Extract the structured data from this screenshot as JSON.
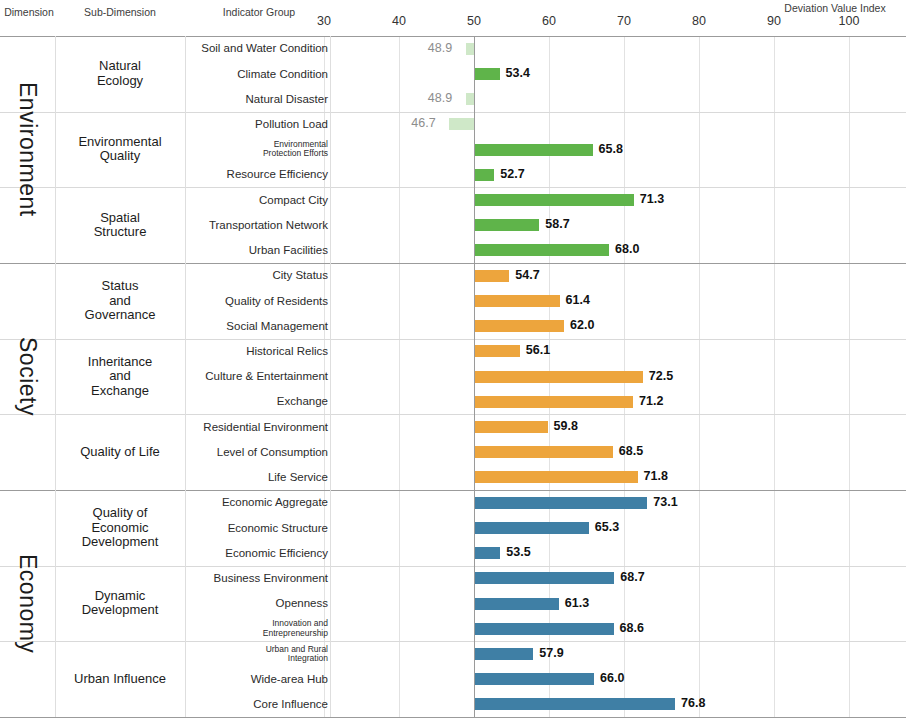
{
  "headers": {
    "dimension": "Dimension",
    "sub_dimension": "Sub-Dimension",
    "indicator_group": "Indicator Group",
    "axis_title": "Deviation Value Index"
  },
  "chart_data": {
    "type": "bar",
    "title": "Deviation Value Index",
    "orientation": "horizontal",
    "baseline": 50,
    "xlabel": "Deviation Value Index",
    "ylabel": "",
    "xlim": [
      25,
      103
    ],
    "ticks": [
      30,
      40,
      50,
      60,
      70,
      80,
      90,
      100
    ],
    "grid": true,
    "legend": "none",
    "colors": {
      "environment": "#5fb44a",
      "society": "#eda53d",
      "economy": "#3f7fa5",
      "below_baseline_opacity": "0.30"
    },
    "dimensions": [
      {
        "name": "Environment",
        "color": "#5fb44a",
        "sub_dimensions": [
          {
            "name": "Natural\nEcology",
            "indicators": [
              {
                "label": "Soil and Water Condition",
                "value": 48.9,
                "small": false
              },
              {
                "label": "Climate Condition",
                "value": 53.4,
                "small": false
              },
              {
                "label": "Natural Disaster",
                "value": 48.9,
                "small": false
              }
            ]
          },
          {
            "name": "Environmental\nQuality",
            "indicators": [
              {
                "label": "Pollution Load",
                "value": 46.7,
                "small": false
              },
              {
                "label": "Environmental\nProtection Efforts",
                "value": 65.8,
                "small": true
              },
              {
                "label": "Resource Efficiency",
                "value": 52.7,
                "small": false
              }
            ]
          },
          {
            "name": "Spatial\nStructure",
            "indicators": [
              {
                "label": "Compact City",
                "value": 71.3,
                "small": false
              },
              {
                "label": "Transportation Network",
                "value": 58.7,
                "small": false
              },
              {
                "label": "Urban Facilities",
                "value": 68.0,
                "small": false
              }
            ]
          }
        ]
      },
      {
        "name": "Society",
        "color": "#eda53d",
        "sub_dimensions": [
          {
            "name": "Status\nand\nGovernance",
            "indicators": [
              {
                "label": "City Status",
                "value": 54.7,
                "small": false
              },
              {
                "label": "Quality of Residents",
                "value": 61.4,
                "small": false
              },
              {
                "label": "Social Management",
                "value": 62.0,
                "small": false
              }
            ]
          },
          {
            "name": "Inheritance\nand\nExchange",
            "indicators": [
              {
                "label": "Historical Relics",
                "value": 56.1,
                "small": false
              },
              {
                "label": "Culture & Entertainment",
                "value": 72.5,
                "small": false
              },
              {
                "label": "Exchange",
                "value": 71.2,
                "small": false
              }
            ]
          },
          {
            "name": "Quality of Life",
            "indicators": [
              {
                "label": "Residential Environment",
                "value": 59.8,
                "small": false
              },
              {
                "label": "Level of Consumption",
                "value": 68.5,
                "small": false
              },
              {
                "label": "Life Service",
                "value": 71.8,
                "small": false
              }
            ]
          }
        ]
      },
      {
        "name": "Economy",
        "color": "#3f7fa5",
        "sub_dimensions": [
          {
            "name": "Quality of\nEconomic\nDevelopment",
            "indicators": [
              {
                "label": "Economic Aggregate",
                "value": 73.1,
                "small": false
              },
              {
                "label": "Economic Structure",
                "value": 65.3,
                "small": false
              },
              {
                "label": "Economic Efficiency",
                "value": 53.5,
                "small": false
              }
            ]
          },
          {
            "name": "Dynamic\nDevelopment",
            "indicators": [
              {
                "label": "Business Environment",
                "value": 68.7,
                "small": false
              },
              {
                "label": "Openness",
                "value": 61.3,
                "small": false
              },
              {
                "label": "Innovation and\nEntrepreneurship",
                "value": 68.6,
                "small": true
              }
            ]
          },
          {
            "name": "Urban Influence",
            "indicators": [
              {
                "label": "Urban and Rural\nIntegration",
                "value": 57.9,
                "small": true
              },
              {
                "label": "Wide-area Hub",
                "value": 66.0,
                "small": false
              },
              {
                "label": "Core Influence",
                "value": 76.8,
                "small": false
              }
            ]
          }
        ]
      }
    ]
  }
}
